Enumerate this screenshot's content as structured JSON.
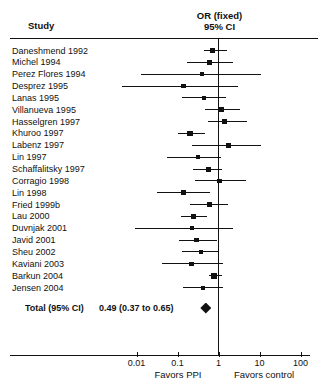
{
  "header": {
    "study_col": "Study",
    "effect_col_line1": "OR (fixed)",
    "effect_col_line2": "95% CI"
  },
  "axis": {
    "scale": "log",
    "ticks": [
      0.01,
      0.1,
      1,
      10,
      100
    ],
    "tick_labels": [
      "0.01",
      "0.1",
      "1",
      "10",
      "100"
    ],
    "left_label": "Favors PPI",
    "right_label": "Favors control"
  },
  "total": {
    "label": "Total (95% CI)",
    "estimate_text": "0.49 (0.37 to 0.65)",
    "or": 0.49,
    "ci_low": 0.37,
    "ci_high": 0.65
  },
  "colors": {
    "foreground": "#111111",
    "background": "#ffffff"
  },
  "chart_data": {
    "type": "forest",
    "effect_measure": "OR (fixed) 95% CI",
    "null_line": 1,
    "xlim": [
      0.01,
      100
    ],
    "x_scale": "log",
    "studies": [
      {
        "name": "Daneshmend 1992",
        "or": 0.71,
        "ci_low": 0.45,
        "ci_high": 1.58,
        "sq": 5
      },
      {
        "name": "Michel 1994",
        "or": 0.62,
        "ci_low": 0.17,
        "ci_high": 2.3,
        "sq": 5
      },
      {
        "name": "Perez Flores 1994",
        "or": 0.4,
        "ci_low": 0.013,
        "ci_high": 11.0,
        "sq": 4
      },
      {
        "name": "Desprez 1995",
        "or": 0.14,
        "ci_low": 0.0045,
        "ci_high": 3.0,
        "sq": 4.5
      },
      {
        "name": "Lanas 1995",
        "or": 0.44,
        "ci_low": 0.13,
        "ci_high": 1.5,
        "sq": 4.5
      },
      {
        "name": "Villanueva 1995",
        "or": 1.2,
        "ci_low": 0.47,
        "ci_high": 3.35,
        "sq": 5
      },
      {
        "name": "Hasselgren 1997",
        "or": 1.39,
        "ci_low": 0.55,
        "ci_high": 5.0,
        "sq": 4.5
      },
      {
        "name": "Khuroo 1997",
        "or": 0.2,
        "ci_low": 0.1,
        "ci_high": 0.47,
        "sq": 5.5
      },
      {
        "name": "Labenz 1997",
        "or": 1.73,
        "ci_low": 0.23,
        "ci_high": 11.0,
        "sq": 4.5
      },
      {
        "name": "Lin 1997",
        "or": 0.32,
        "ci_low": 0.055,
        "ci_high": 1.15,
        "sq": 4.5
      },
      {
        "name": "Schaffalitsky 1997",
        "or": 0.56,
        "ci_low": 0.24,
        "ci_high": 1.24,
        "sq": 5
      },
      {
        "name": "Corragio 1998",
        "or": 1.05,
        "ci_low": 0.26,
        "ci_high": 4.6,
        "sq": 4.5
      },
      {
        "name": "Lin 1998",
        "or": 0.14,
        "ci_low": 0.031,
        "ci_high": 0.62,
        "sq": 4.5
      },
      {
        "name": "Fried 1999b",
        "or": 0.6,
        "ci_low": 0.2,
        "ci_high": 1.73,
        "sq": 5
      },
      {
        "name": "Lau 2000",
        "or": 0.25,
        "ci_low": 0.12,
        "ci_high": 0.53,
        "sq": 5
      },
      {
        "name": "Duvnjak 2001",
        "or": 0.22,
        "ci_low": 0.0092,
        "ci_high": 2.3,
        "sq": 4
      },
      {
        "name": "Javid 2001",
        "or": 0.29,
        "ci_low": 0.11,
        "ci_high": 0.94,
        "sq": 4.5
      },
      {
        "name": "Sheu 2002",
        "or": 0.37,
        "ci_low": 0.126,
        "ci_high": 1.05,
        "sq": 4.5
      },
      {
        "name": "Kaviani 2003",
        "or": 0.22,
        "ci_low": 0.041,
        "ci_high": 1.31,
        "sq": 4.5
      },
      {
        "name": "Barkun 2004",
        "or": 0.79,
        "ci_low": 0.6,
        "ci_high": 1.2,
        "sq": 6
      },
      {
        "name": "Jensen 2004",
        "or": 0.41,
        "ci_low": 0.138,
        "ci_high": 1.31,
        "sq": 4
      }
    ],
    "total": {
      "label": "Total (95% CI)",
      "or": 0.49,
      "ci_low": 0.37,
      "ci_high": 0.65
    },
    "footer": {
      "left": "Favors PPI",
      "right": "Favors control"
    }
  }
}
